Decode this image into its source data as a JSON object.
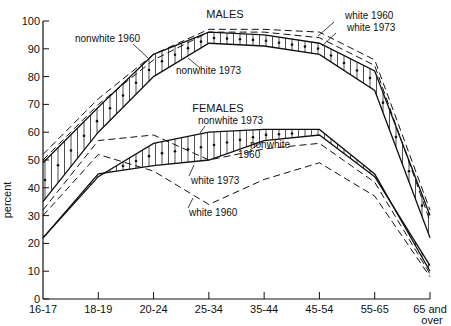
{
  "chart_data": {
    "type": "line",
    "title": "",
    "xlabel": "",
    "ylabel": "percent",
    "ylim": [
      0,
      100
    ],
    "yticks": [
      0,
      10,
      20,
      30,
      40,
      50,
      60,
      70,
      80,
      90,
      100
    ],
    "grid": false,
    "categories": [
      "16-17",
      "18-19",
      "20-24",
      "25-34",
      "35-44",
      "45-54",
      "55-65",
      "65 and over"
    ],
    "groups": [
      {
        "name": "MALES",
        "series": [
          {
            "name": "white 1960",
            "style": "dashed",
            "values": [
              52,
              72,
              88,
              97,
              97,
              96,
              86,
              32
            ]
          },
          {
            "name": "white 1973",
            "style": "dashed",
            "values": [
              50,
              70,
              86,
              96,
              96,
              94,
              84,
              28
            ]
          },
          {
            "name": "nonwhite 1960",
            "style": "solid",
            "values": [
              49,
              69,
              88,
              96,
              95,
              92,
              82,
              30
            ]
          },
          {
            "name": "nonwhite 1973",
            "style": "solid",
            "values": [
              35,
              60,
              80,
              92,
              91,
              88,
              75,
              22
            ]
          }
        ]
      },
      {
        "name": "FEMALES",
        "series": [
          {
            "name": "nonwhite 1973",
            "style": "solid",
            "values": [
              22,
              44,
              56,
              60,
              61,
              61,
              45,
              10
            ]
          },
          {
            "name": "nonwhite 1960",
            "style": "solid",
            "values": [
              22,
              45,
              48,
              50,
              57,
              59,
              44,
              12
            ]
          },
          {
            "name": "white 1973",
            "style": "dashed",
            "values": [
              32,
              57,
              59,
              50,
              54,
              56,
              42,
              9
            ]
          },
          {
            "name": "white 1960",
            "style": "dashed",
            "values": [
              30,
              52,
              46,
              34,
              43,
              49,
              37,
              8
            ]
          }
        ]
      }
    ],
    "annotations": [
      "MALES",
      "FEMALES",
      "nonwhite 1960",
      "nonwhite 1973",
      "white 1960",
      "white 1973"
    ],
    "shading": "hatched band between nonwhite 1960 and nonwhite 1973 for each sex"
  },
  "labels": {
    "ylabel": "percent",
    "males": "MALES",
    "females": "FEMALES",
    "m_nw60": "nonwhite 1960",
    "m_nw73": "nonwhite 1973",
    "m_w60": "white 1960",
    "m_w73": "white 1973",
    "f_nw73": "nonwhite 1973",
    "f_nw60a": "nonwhite",
    "f_nw60b": "1960",
    "f_w73": "white 1973",
    "f_w60": "white 1960",
    "x_last_a": "65 and",
    "x_last_b": "over"
  }
}
